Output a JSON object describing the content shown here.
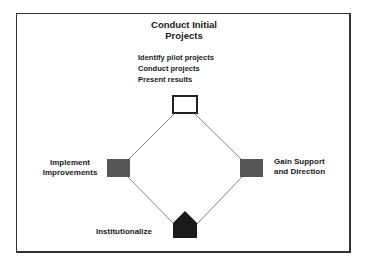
{
  "diagram": {
    "title_line1": "Conduct Initial",
    "title_line2": "Projects",
    "top_node": {
      "label": "Conduct Initial Projects",
      "steps": [
        "Identify pilot projects",
        "Conduct projects",
        "Present results"
      ],
      "shape": "hollow-square"
    },
    "right_node": {
      "line1": "Gain Support",
      "line2": "and Direction",
      "shape": "gray-square"
    },
    "bottom_node": {
      "label": "Institutionalize",
      "shape": "black-pentagon"
    },
    "left_node": {
      "line1": "Implement",
      "line2": "Improvements",
      "shape": "gray-square"
    },
    "colors": {
      "frame": "#333333",
      "gray_node": "#555555",
      "dark_node": "#1a1a1a",
      "line": "#777777"
    }
  }
}
